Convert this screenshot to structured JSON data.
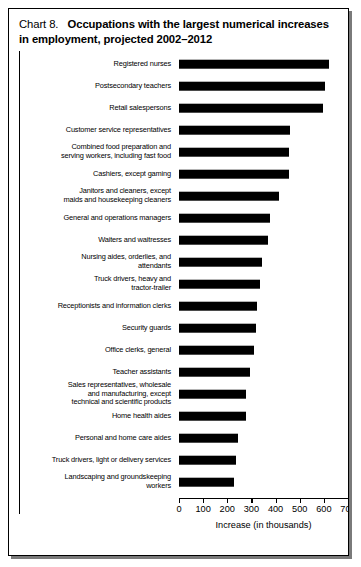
{
  "title": {
    "number": "Chart 8.",
    "text": "Occupations with the largest numerical increases in employment, projected 2002–2012"
  },
  "chart_data": {
    "type": "bar",
    "orientation": "horizontal",
    "xlabel": "Increase (in thousands)",
    "ylabel": "",
    "xlim": [
      0,
      700
    ],
    "xticks": [
      0,
      100,
      200,
      300,
      400,
      500,
      600,
      700
    ],
    "xtick_labels": [
      "0",
      "100",
      "200",
      "300",
      "400",
      "500",
      "600",
      "700"
    ],
    "grid": false,
    "legend": null,
    "bar_color": "#000000",
    "categories": [
      "Registered nurses",
      "Postsecondary teachers",
      "Retail salespersons",
      "Customer service representatives",
      "Combined food preparation and\nserving workers, including fast food",
      "Cashiers, except gaming",
      "Janitors and cleaners, except\nmaids and housekeeping cleaners",
      "General and operations managers",
      "Waiters and waitresses",
      "Nursing aides, orderlies, and\nattendants",
      "Truck drivers, heavy and\ntractor-trailer",
      "Receptionists and information clerks",
      "Security guards",
      "Office clerks, general",
      "Teacher assistants",
      "Sales representatives, wholesale\nand manufacturing, except\ntechnical and scientific products",
      "Home health aides",
      "Personal and home care aides",
      "Truck drivers, light or delivery services",
      "Landscaping and groundskeeping\nworkers"
    ],
    "values": [
      623,
      603,
      596,
      460,
      454,
      454,
      414,
      376,
      367,
      343,
      337,
      325,
      317,
      310,
      294,
      279,
      279,
      246,
      236,
      229
    ]
  },
  "axis": {
    "xlabel": "Increase (in thousands)"
  }
}
